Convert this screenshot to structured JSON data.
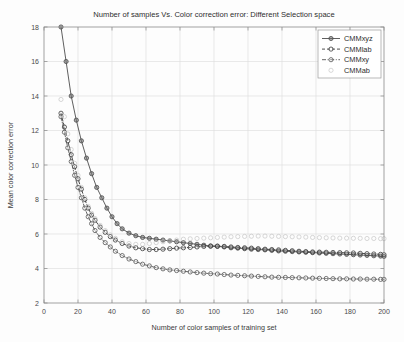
{
  "chart_data": {
    "type": "line",
    "title": "Number of samples Vs. Color correction error: Different Selection space",
    "xlabel": "Number of color samples of training set",
    "ylabel": "Mean color correction error",
    "xlim": [
      0,
      200
    ],
    "ylim": [
      2,
      18
    ],
    "xticks": [
      0,
      20,
      40,
      60,
      80,
      100,
      120,
      140,
      160,
      180,
      200
    ],
    "yticks": [
      2,
      4,
      6,
      8,
      10,
      12,
      14,
      16,
      18
    ],
    "grid": true,
    "legend_position": "top-right",
    "legend": [
      "CMMxyz",
      "CMMlab",
      "CMMxy",
      "CMMab"
    ],
    "series": [
      {
        "name": "CMMxyz",
        "color": "#4d4d4d",
        "linestyle": "solid",
        "marker": "circle-filled",
        "x": [
          10,
          13,
          16,
          19,
          22,
          25,
          28,
          31,
          34,
          37,
          40,
          43,
          46,
          50,
          54,
          58,
          62,
          66,
          70,
          74,
          78,
          82,
          86,
          90,
          94,
          98,
          102,
          106,
          110,
          114,
          118,
          122,
          126,
          130,
          134,
          138,
          142,
          146,
          150,
          154,
          158,
          162,
          166,
          170,
          174,
          178,
          182,
          186,
          190,
          194,
          198,
          200
        ],
        "y": [
          18.0,
          16.0,
          14.0,
          12.6,
          11.4,
          10.4,
          9.5,
          8.7,
          8.1,
          7.5,
          7.0,
          6.6,
          6.3,
          6.05,
          5.9,
          5.8,
          5.75,
          5.7,
          5.65,
          5.6,
          5.55,
          5.5,
          5.45,
          5.4,
          5.35,
          5.3,
          5.28,
          5.25,
          5.2,
          5.18,
          5.15,
          5.12,
          5.1,
          5.08,
          5.05,
          5.02,
          5.0,
          4.98,
          4.96,
          4.94,
          4.92,
          4.9,
          4.88,
          4.86,
          4.84,
          4.82,
          4.8,
          4.78,
          4.76,
          4.74,
          4.72,
          4.7
        ]
      },
      {
        "name": "CMMlab",
        "color": "#3a3a3a",
        "linestyle": "dashed",
        "marker": "circle-open",
        "x": [
          10,
          12,
          14,
          16,
          18,
          20,
          22,
          24,
          26,
          28,
          30,
          33,
          36,
          39,
          42,
          46,
          50,
          54,
          58,
          62,
          66,
          70,
          74,
          78,
          82,
          86,
          90,
          94,
          98,
          102,
          106,
          110,
          114,
          118,
          122,
          126,
          130,
          134,
          138,
          142,
          146,
          150,
          154,
          158,
          162,
          166,
          170,
          174,
          178,
          182,
          186,
          190,
          194,
          198,
          200
        ],
        "y": [
          13.0,
          12.2,
          11.4,
          10.6,
          9.9,
          9.2,
          8.6,
          8.0,
          7.5,
          7.1,
          6.8,
          6.4,
          6.1,
          5.85,
          5.65,
          5.45,
          5.3,
          5.2,
          5.15,
          5.1,
          5.1,
          5.12,
          5.15,
          5.18,
          5.2,
          5.22,
          5.25,
          5.28,
          5.3,
          5.3,
          5.28,
          5.25,
          5.22,
          5.2,
          5.18,
          5.15,
          5.12,
          5.1,
          5.08,
          5.05,
          5.03,
          5.0,
          4.98,
          4.96,
          4.95,
          4.94,
          4.93,
          4.92,
          4.91,
          4.9,
          4.88,
          4.86,
          4.84,
          4.82,
          4.8
        ]
      },
      {
        "name": "CMMxy",
        "color": "#555555",
        "linestyle": "dashdot",
        "marker": "circle-open",
        "x": [
          10,
          12,
          14,
          16,
          18,
          20,
          22,
          24,
          26,
          28,
          30,
          33,
          36,
          39,
          42,
          46,
          50,
          54,
          58,
          62,
          66,
          70,
          74,
          78,
          82,
          86,
          90,
          94,
          98,
          102,
          106,
          110,
          114,
          118,
          122,
          126,
          130,
          134,
          138,
          142,
          146,
          150,
          154,
          158,
          162,
          166,
          170,
          174,
          178,
          182,
          186,
          190,
          194,
          198,
          200
        ],
        "y": [
          12.8,
          11.9,
          11.0,
          10.2,
          9.4,
          8.7,
          8.1,
          7.5,
          7.0,
          6.6,
          6.2,
          5.8,
          5.5,
          5.25,
          5.0,
          4.75,
          4.55,
          4.4,
          4.25,
          4.15,
          4.05,
          3.98,
          3.92,
          3.88,
          3.84,
          3.8,
          3.76,
          3.73,
          3.7,
          3.68,
          3.65,
          3.62,
          3.6,
          3.58,
          3.56,
          3.54,
          3.52,
          3.5,
          3.49,
          3.48,
          3.47,
          3.46,
          3.45,
          3.44,
          3.43,
          3.42,
          3.41,
          3.4,
          3.4,
          3.39,
          3.39,
          3.38,
          3.38,
          3.37,
          3.37
        ]
      },
      {
        "name": "CMMab",
        "color": "#c2c2c2",
        "linestyle": "none",
        "marker": "circle-open-light",
        "x": [
          10,
          12,
          14,
          16,
          18,
          20,
          22,
          24,
          26,
          28,
          30,
          33,
          36,
          39,
          42,
          46,
          50,
          54,
          58,
          62,
          66,
          70,
          74,
          78,
          82,
          86,
          90,
          94,
          98,
          102,
          106,
          110,
          114,
          118,
          122,
          126,
          130,
          134,
          138,
          142,
          146,
          150,
          154,
          158,
          162,
          166,
          170,
          174,
          178,
          182,
          186,
          190,
          194,
          198,
          200
        ],
        "y": [
          13.8,
          12.8,
          11.8,
          10.9,
          10.1,
          9.4,
          8.7,
          8.1,
          7.6,
          7.2,
          6.9,
          6.5,
          6.2,
          5.95,
          5.75,
          5.55,
          5.45,
          5.4,
          5.4,
          5.45,
          5.5,
          5.55,
          5.6,
          5.65,
          5.7,
          5.72,
          5.74,
          5.76,
          5.78,
          5.8,
          5.82,
          5.84,
          5.85,
          5.86,
          5.87,
          5.88,
          5.88,
          5.87,
          5.86,
          5.85,
          5.84,
          5.83,
          5.82,
          5.8,
          5.79,
          5.78,
          5.77,
          5.76,
          5.76,
          5.75,
          5.75,
          5.74,
          5.74,
          5.73,
          5.73
        ]
      }
    ]
  }
}
